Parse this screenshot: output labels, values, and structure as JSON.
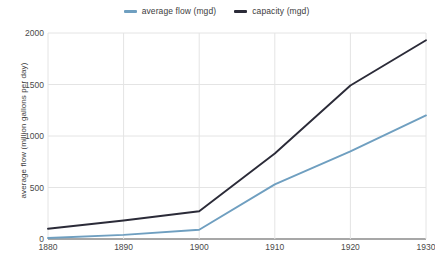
{
  "chart_data": {
    "type": "line",
    "title": "",
    "xlabel": "",
    "ylabel": "average flow (million gallons per day)",
    "x": [
      1880,
      1890,
      1900,
      1910,
      1920,
      1930
    ],
    "xlim": [
      1880,
      1930
    ],
    "ylim": [
      0,
      2000
    ],
    "xticks": [
      "1880",
      "1890",
      "1900",
      "1910",
      "1920",
      "1930"
    ],
    "yticks": [
      "0",
      "500",
      "1000",
      "1500",
      "2000"
    ],
    "ytick_values": [
      0,
      500,
      1000,
      1500,
      2000
    ],
    "grid": true,
    "legend_position": "top-center",
    "series": [
      {
        "name": "average flow (mgd)",
        "color": "#6f9fc0",
        "values": [
          10,
          40,
          90,
          530,
          850,
          1200
        ]
      },
      {
        "name": "capacity (mgd)",
        "color": "#2b2b38",
        "values": [
          100,
          180,
          270,
          830,
          1490,
          1930
        ]
      }
    ]
  },
  "legend": {
    "entries": [
      {
        "label": "average flow (mgd)",
        "color": "#6f9fc0"
      },
      {
        "label": "capacity (mgd)",
        "color": "#2b2b38"
      }
    ]
  },
  "axes": {
    "y_title": "average flow (million gallons per day)"
  },
  "colors": {
    "grid": "#e4e4e4",
    "axis": "#8a8a8a",
    "text": "#4a4a4a"
  }
}
